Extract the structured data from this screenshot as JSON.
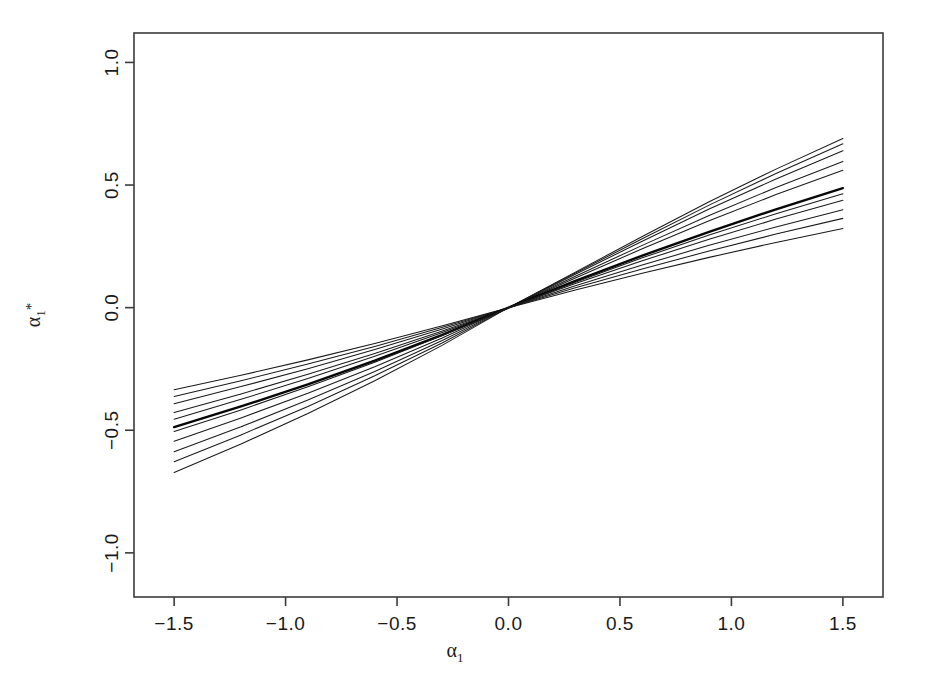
{
  "figure": {
    "background_color": "#ffffff",
    "line_color": "#1b1b1b",
    "frame_color": "#3b3b3b",
    "width": 929,
    "height": 676
  },
  "chart_data": {
    "type": "line",
    "title": "",
    "subtitle": "",
    "xlabel": "α₁",
    "ylabel": "α₁*",
    "xlabel_parts": {
      "base": "α",
      "sub": "1",
      "sup": ""
    },
    "ylabel_parts": {
      "base": "α",
      "sub": "1",
      "sup": "*"
    },
    "xlim": [
      -1.68,
      1.68
    ],
    "ylim": [
      -1.18,
      1.12
    ],
    "xticks": [
      -1.5,
      -1.0,
      -0.5,
      0.0,
      0.5,
      1.0,
      1.5
    ],
    "xticklabels": [
      "-1.5",
      "-1.0",
      "-0.5",
      "0.0",
      "0.5",
      "1.0",
      "1.5"
    ],
    "yticks": [
      -1.0,
      -0.5,
      0.0,
      0.5,
      1.0
    ],
    "yticklabels": [
      "-1.0",
      "-0.5",
      "0.0",
      "0.5",
      "1.0"
    ],
    "grid": false,
    "legend": null,
    "legend_position": "none",
    "x": [
      -1.5,
      -1.2,
      -0.9,
      -0.6,
      -0.3,
      0.0,
      0.3,
      0.6,
      0.9,
      1.2,
      1.5
    ],
    "series": [
      {
        "name": "curve-1",
        "emphasis": "normal",
        "values": [
          -0.335,
          -0.276,
          -0.213,
          -0.146,
          -0.075,
          0.0,
          0.145,
          0.29,
          0.432,
          0.565,
          0.69
        ]
      },
      {
        "name": "curve-2",
        "emphasis": "normal",
        "values": [
          -0.362,
          -0.298,
          -0.23,
          -0.158,
          -0.081,
          0.0,
          0.141,
          0.281,
          0.418,
          0.547,
          0.668
        ]
      },
      {
        "name": "curve-3",
        "emphasis": "normal",
        "values": [
          -0.392,
          -0.322,
          -0.249,
          -0.171,
          -0.088,
          0.0,
          0.136,
          0.271,
          0.402,
          0.525,
          0.64
        ]
      },
      {
        "name": "curve-4",
        "emphasis": "normal",
        "values": [
          -0.428,
          -0.352,
          -0.272,
          -0.187,
          -0.096,
          0.0,
          0.128,
          0.254,
          0.376,
          0.49,
          0.596
        ]
      },
      {
        "name": "curve-5",
        "emphasis": "normal",
        "values": [
          -0.455,
          -0.374,
          -0.289,
          -0.198,
          -0.102,
          0.0,
          0.121,
          0.24,
          0.354,
          0.461,
          0.56
        ]
      },
      {
        "name": "curve-6-bold",
        "emphasis": "bold",
        "values": [
          -0.487,
          -0.403,
          -0.313,
          -0.216,
          -0.112,
          0.0,
          0.109,
          0.212,
          0.309,
          0.401,
          0.487
        ]
      },
      {
        "name": "curve-7",
        "emphasis": "normal",
        "values": [
          -0.505,
          -0.417,
          -0.323,
          -0.223,
          -0.115,
          0.0,
          0.104,
          0.203,
          0.296,
          0.383,
          0.464
        ]
      },
      {
        "name": "curve-8",
        "emphasis": "normal",
        "values": [
          -0.545,
          -0.45,
          -0.349,
          -0.241,
          -0.125,
          0.0,
          0.098,
          0.191,
          0.279,
          0.361,
          0.438
        ]
      },
      {
        "name": "curve-9",
        "emphasis": "normal",
        "values": [
          -0.588,
          -0.486,
          -0.377,
          -0.26,
          -0.135,
          0.0,
          0.089,
          0.174,
          0.254,
          0.329,
          0.399
        ]
      },
      {
        "name": "curve-10",
        "emphasis": "normal",
        "values": [
          -0.628,
          -0.519,
          -0.403,
          -0.278,
          -0.145,
          0.0,
          0.081,
          0.158,
          0.231,
          0.3,
          0.364
        ]
      },
      {
        "name": "curve-11",
        "emphasis": "normal",
        "values": [
          -0.672,
          -0.556,
          -0.432,
          -0.298,
          -0.155,
          0.0,
          0.072,
          0.14,
          0.205,
          0.266,
          0.323
        ]
      }
    ]
  }
}
